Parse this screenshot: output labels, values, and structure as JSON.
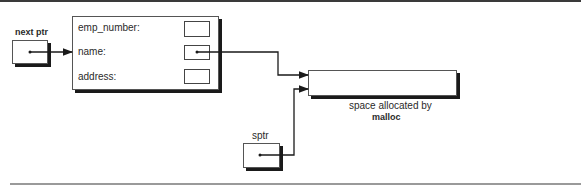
{
  "diagram": {
    "next_ptr": {
      "label": "next ptr"
    },
    "record": {
      "fields": [
        {
          "label": "emp_number:"
        },
        {
          "label": "name:"
        },
        {
          "label": "address:"
        }
      ]
    },
    "malloc_block": {
      "caption_line1": "space allocated by",
      "caption_line2": "malloc"
    },
    "sptr": {
      "label": "sptr"
    },
    "colors": {
      "line": "#1a1a1a",
      "shadow": "#1a1a1a",
      "border": "#555555"
    }
  }
}
